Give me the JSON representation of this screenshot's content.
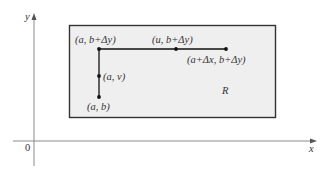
{
  "diagram": {
    "axes": {
      "x_label": "x",
      "y_label": "y",
      "origin_label": "0",
      "axis_color": "#8a8a8a"
    },
    "region": {
      "label": "R",
      "fill": "#efefef",
      "stroke": "#333333"
    },
    "points": [
      {
        "id": "top-left",
        "label": "(a, b+Δy)"
      },
      {
        "id": "top-mid",
        "label": "(u, b+Δy)"
      },
      {
        "id": "top-right",
        "label": "(a+Δx, b+Δy)"
      },
      {
        "id": "mid-left",
        "label": "(a, v)"
      },
      {
        "id": "bottom-left",
        "label": "(a, b)"
      }
    ],
    "path_color": "#111111"
  }
}
